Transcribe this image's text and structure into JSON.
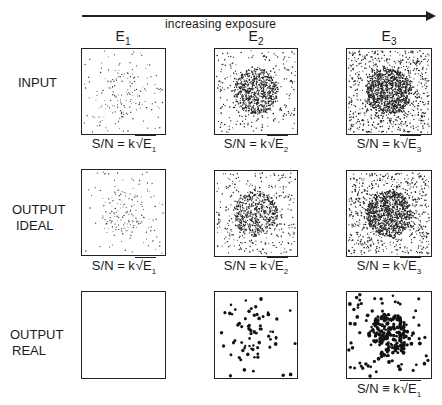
{
  "header": {
    "arrow_label": "increasing exposure"
  },
  "columns": [
    {
      "label": "E",
      "sub": "1"
    },
    {
      "label": "E",
      "sub": "2"
    },
    {
      "label": "E",
      "sub": "3"
    }
  ],
  "rows": [
    {
      "label_line1": "INPUT",
      "label_line2": ""
    },
    {
      "label_line1": "OUTPUT",
      "label_line2": "IDEAL"
    },
    {
      "label_line1": "OUTPUT",
      "label_line2": "REAL"
    }
  ],
  "captions": {
    "input": [
      {
        "prefix": "S/N = k",
        "rad": "E",
        "sub": "1"
      },
      {
        "prefix": "S/N = k",
        "rad": "E",
        "sub": "2"
      },
      {
        "prefix": "S/N = k",
        "rad": "E",
        "sub": "3"
      }
    ],
    "ideal": [
      {
        "prefix": "S/N = k",
        "rad": "E",
        "sub": "1"
      },
      {
        "prefix": "S/N = k",
        "rad": "E",
        "sub": "2"
      },
      {
        "prefix": "S/N = k",
        "rad": "E",
        "sub": "3"
      }
    ],
    "real": [
      {
        "prefix": "S/N ≡ k",
        "rad": "E",
        "sub": "1"
      }
    ]
  },
  "panels": {
    "input": [
      {
        "bg_dots": 110,
        "center_dots": 70,
        "center_r": 0.28,
        "dot_size": 0.7,
        "fill": "#333"
      },
      {
        "bg_dots": 260,
        "center_dots": 650,
        "center_r": 0.27,
        "dot_size": 0.8,
        "fill": "#222"
      },
      {
        "bg_dots": 750,
        "center_dots": 900,
        "center_r": 0.27,
        "dot_size": 0.8,
        "fill": "#222"
      }
    ],
    "ideal": [
      {
        "bg_dots": 90,
        "center_dots": 90,
        "center_r": 0.26,
        "dot_size": 0.7,
        "fill": "#333"
      },
      {
        "bg_dots": 320,
        "center_dots": 480,
        "center_r": 0.27,
        "dot_size": 0.8,
        "fill": "#222"
      },
      {
        "bg_dots": 700,
        "center_dots": 850,
        "center_r": 0.27,
        "dot_size": 0.8,
        "fill": "#222"
      }
    ],
    "real": [
      {
        "bg_dots": 0,
        "center_dots": 0,
        "center_r": 0.2,
        "dot_size": 1.8,
        "fill": "#111"
      },
      {
        "bg_dots": 40,
        "center_dots": 28,
        "center_r": 0.25,
        "dot_size": 1.8,
        "fill": "#111"
      },
      {
        "bg_dots": 85,
        "center_dots": 150,
        "center_r": 0.25,
        "dot_size": 1.9,
        "fill": "#111"
      }
    ]
  }
}
